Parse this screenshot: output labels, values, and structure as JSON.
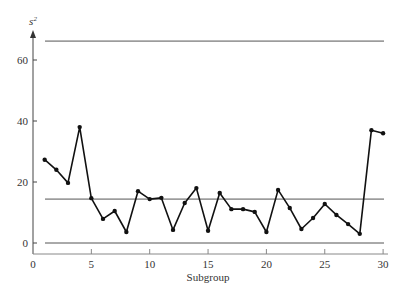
{
  "chart_data": {
    "type": "line",
    "title": "",
    "xlabel": "Subgroup",
    "ylabel": "s²",
    "ylabel_base": "s",
    "ylabel_sup": "2",
    "xlim": [
      0,
      30.5
    ],
    "ylim": [
      0,
      70
    ],
    "xticks": [
      0,
      5,
      10,
      15,
      20,
      25,
      30
    ],
    "yticks": [
      0,
      20,
      40,
      60
    ],
    "grid": false,
    "x": [
      1,
      2,
      3,
      4,
      5,
      6,
      7,
      8,
      9,
      10,
      11,
      12,
      13,
      14,
      15,
      16,
      17,
      18,
      19,
      20,
      21,
      22,
      23,
      24,
      25,
      26,
      27,
      28,
      29,
      30
    ],
    "series": [
      {
        "name": "s2",
        "values": [
          27.3,
          24.0,
          19.7,
          38.0,
          14.7,
          7.9,
          10.5,
          3.6,
          17.0,
          14.4,
          14.8,
          4.3,
          13.1,
          18.0,
          4.0,
          16.4,
          11.1,
          11.1,
          10.2,
          3.6,
          17.4,
          11.5,
          4.6,
          8.2,
          12.8,
          9.2,
          6.2,
          3.0,
          37.0,
          36.0
        ]
      }
    ],
    "control_lines": [
      {
        "name": "UCL",
        "value": 66.2
      },
      {
        "name": "CL",
        "value": 14.4
      },
      {
        "name": "LCL",
        "value": 0
      }
    ]
  }
}
